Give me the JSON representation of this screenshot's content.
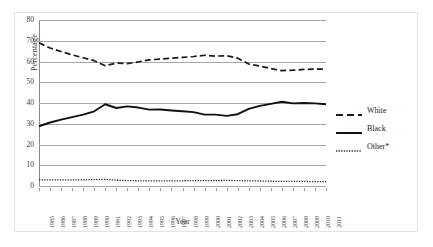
{
  "chart_data": {
    "type": "line",
    "title": "",
    "xlabel": "Year",
    "ylabel": "Percentage",
    "ylim": [
      0,
      80
    ],
    "yticks": [
      0,
      10,
      20,
      30,
      40,
      50,
      60,
      70,
      80
    ],
    "grid": true,
    "legend_position": "right",
    "categories": [
      "1985",
      "1986",
      "1987",
      "1988",
      "1989",
      "1990",
      "1991",
      "1992",
      "1993",
      "1994",
      "1995",
      "1996",
      "1997",
      "1998",
      "1999",
      "2000",
      "2001",
      "2002",
      "2003",
      "2004",
      "2005",
      "2006",
      "2007",
      "2008",
      "2009",
      "2010",
      "2011"
    ],
    "series": [
      {
        "name": "White",
        "style": "dashed",
        "color": "#1a1a1a",
        "values": [
          69.0,
          66.5,
          64.8,
          63.2,
          61.8,
          60.4,
          58.0,
          59.2,
          59.0,
          59.8,
          60.8,
          61.2,
          61.6,
          62.0,
          62.4,
          63.0,
          62.6,
          62.8,
          61.6,
          58.8,
          57.8,
          56.6,
          55.6,
          55.8,
          56.2,
          56.3,
          56.4
        ]
      },
      {
        "name": "Black",
        "style": "solid",
        "color": "#101010",
        "values": [
          28.8,
          30.6,
          32.0,
          33.2,
          34.4,
          36.0,
          39.4,
          37.6,
          38.4,
          37.8,
          36.8,
          36.9,
          36.4,
          36.0,
          35.6,
          34.4,
          34.4,
          33.8,
          34.6,
          37.2,
          38.6,
          39.6,
          40.6,
          39.8,
          40.0,
          39.8,
          39.4
        ]
      },
      {
        "name": "Other*",
        "style": "dotted",
        "color": "#2a2a2a",
        "values": [
          3.0,
          3.0,
          3.0,
          3.0,
          3.0,
          3.1,
          3.2,
          2.8,
          2.6,
          2.5,
          2.5,
          2.5,
          2.5,
          2.5,
          2.6,
          2.6,
          2.6,
          2.7,
          2.6,
          2.5,
          2.4,
          2.3,
          2.2,
          2.2,
          2.2,
          2.1,
          2.1
        ]
      }
    ]
  },
  "axes": {
    "y_title": "Percentage",
    "x_title": "Year"
  },
  "legend": {
    "items": [
      {
        "label": "White"
      },
      {
        "label": "Black"
      },
      {
        "label": "Other*"
      }
    ]
  }
}
